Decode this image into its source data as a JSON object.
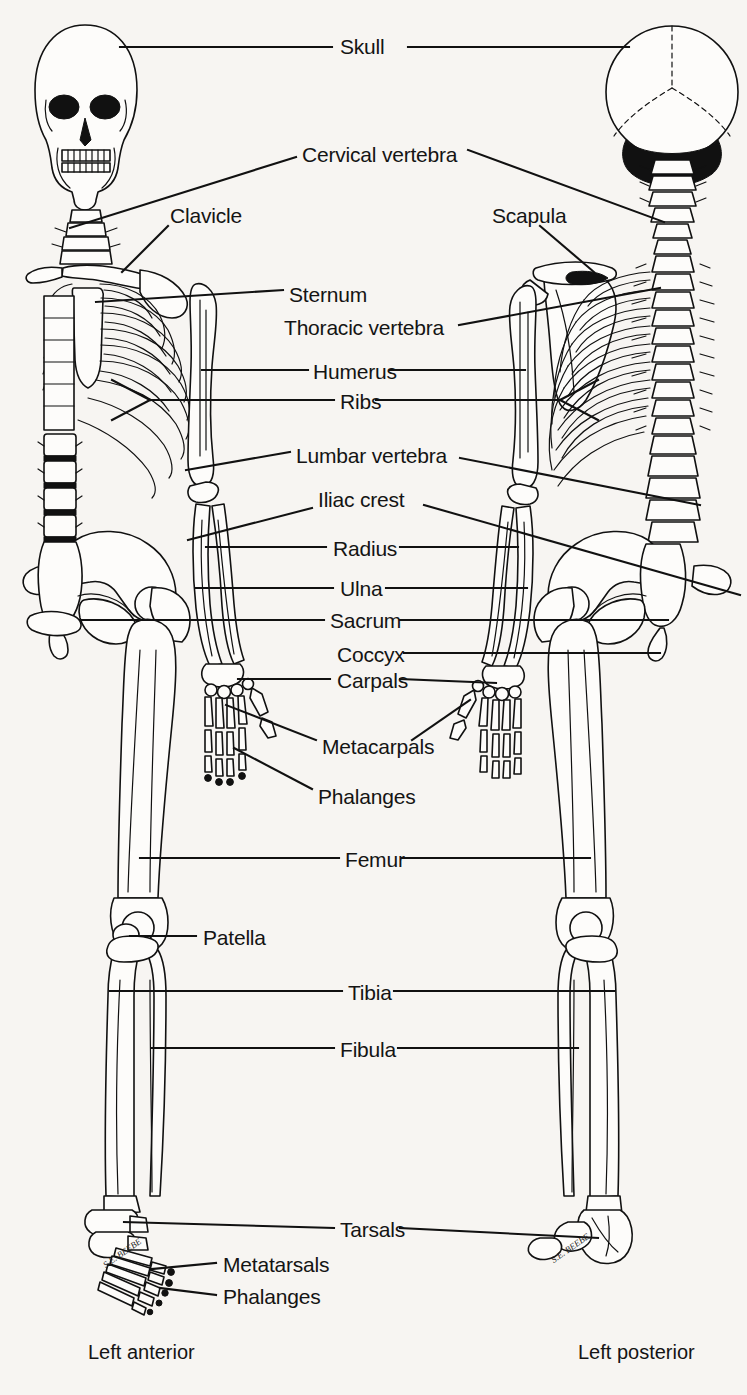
{
  "diagram": {
    "views": {
      "left_caption": "Left anterior",
      "right_caption": "Left posterior"
    },
    "artist_signature": "S.E. BEEBE",
    "ink_color": "#111111",
    "background_color": "#f7f5f2",
    "bone_fill_color": "#fdfcfa"
  },
  "labels": [
    {
      "id": "skull",
      "text": "Skull",
      "x": 340,
      "y": 47,
      "side": "both"
    },
    {
      "id": "cervical-vertebra",
      "text": "Cervical vertebra",
      "x": 302,
      "y": 155,
      "side": "both"
    },
    {
      "id": "clavicle",
      "text": "Clavicle",
      "x": 170,
      "y": 216,
      "side": "left"
    },
    {
      "id": "scapula",
      "text": "Scapula",
      "x": 492,
      "y": 216,
      "side": "right"
    },
    {
      "id": "sternum",
      "text": "Sternum",
      "x": 289,
      "y": 295,
      "side": "left"
    },
    {
      "id": "thoracic-vertebra",
      "text": "Thoracic vertebra",
      "x": 284,
      "y": 328,
      "side": "right"
    },
    {
      "id": "humerus",
      "text": "Humerus",
      "x": 313,
      "y": 372,
      "side": "both"
    },
    {
      "id": "ribs",
      "text": "Ribs",
      "x": 340,
      "y": 402,
      "side": "both"
    },
    {
      "id": "lumbar-vertebra",
      "text": "Lumbar vertebra",
      "x": 296,
      "y": 456,
      "side": "both"
    },
    {
      "id": "iliac-crest",
      "text": "Iliac crest",
      "x": 318,
      "y": 500,
      "side": "both"
    },
    {
      "id": "radius",
      "text": "Radius",
      "x": 333,
      "y": 549,
      "side": "both"
    },
    {
      "id": "ulna",
      "text": "Ulna",
      "x": 340,
      "y": 589,
      "side": "both"
    },
    {
      "id": "sacrum",
      "text": "Sacrum",
      "x": 330,
      "y": 621,
      "side": "both"
    },
    {
      "id": "coccyx",
      "text": "Coccyx",
      "x": 337,
      "y": 655,
      "side": "both"
    },
    {
      "id": "carpals",
      "text": "Carpals",
      "x": 337,
      "y": 681,
      "side": "both"
    },
    {
      "id": "metacarpals",
      "text": "Metacarpals",
      "x": 322,
      "y": 747,
      "side": "both"
    },
    {
      "id": "phalanges-hand",
      "text": "Phalanges",
      "x": 318,
      "y": 797,
      "side": "left"
    },
    {
      "id": "femur",
      "text": "Femur",
      "x": 345,
      "y": 860,
      "side": "both"
    },
    {
      "id": "patella",
      "text": "Patella",
      "x": 203,
      "y": 938,
      "side": "left"
    },
    {
      "id": "tibia",
      "text": "Tibia",
      "x": 348,
      "y": 993,
      "side": "both"
    },
    {
      "id": "fibula",
      "text": "Fibula",
      "x": 340,
      "y": 1050,
      "side": "both"
    },
    {
      "id": "tarsals",
      "text": "Tarsals",
      "x": 340,
      "y": 1230,
      "side": "both"
    },
    {
      "id": "metatarsals",
      "text": "Metatarsals",
      "x": 223,
      "y": 1265,
      "side": "left"
    },
    {
      "id": "phalanges-foot",
      "text": "Phalanges",
      "x": 223,
      "y": 1297,
      "side": "left"
    }
  ],
  "captions": [
    {
      "id": "left-anterior",
      "text": "Left anterior",
      "x": 88,
      "y": 1352
    },
    {
      "id": "left-posterior",
      "text": "Left posterior",
      "x": 578,
      "y": 1352
    }
  ],
  "signatures": [
    {
      "id": "signature-left",
      "text": "S.E. BEEBE",
      "x": 100,
      "y": 1248
    },
    {
      "id": "signature-right",
      "text": "S.E. BEEBE",
      "x": 548,
      "y": 1243
    }
  ]
}
